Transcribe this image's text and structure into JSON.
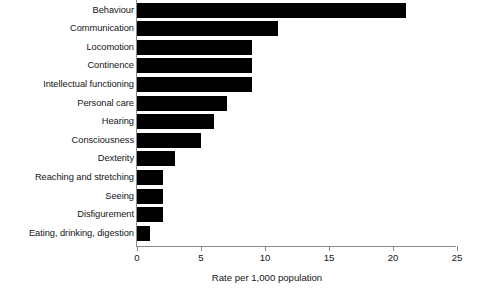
{
  "chart_data": {
    "type": "bar",
    "orientation": "horizontal",
    "title": "",
    "subtitle": "",
    "xlabel": "Rate per 1,000 population",
    "ylabel": "",
    "xlim": [
      0,
      25
    ],
    "xticks": [
      0,
      5,
      10,
      15,
      20,
      25
    ],
    "xtick_labels": [
      "0",
      "5",
      "10",
      "15",
      "20",
      "25"
    ],
    "grid": false,
    "legend": false,
    "bar_color": "#000000",
    "axis_color": "#8a8a8a",
    "categories": [
      "Behaviour",
      "Communication",
      "Locomotion",
      "Continence",
      "Intellectual functioning",
      "Personal care",
      "Hearing",
      "Consciousness",
      "Dexterity",
      "Reaching and stretching",
      "Seeing",
      "Disfigurement",
      "Eating, drinking, digestion"
    ],
    "values": [
      21,
      11,
      9,
      9,
      9,
      7,
      6,
      5,
      3,
      2,
      2,
      2,
      1
    ]
  }
}
